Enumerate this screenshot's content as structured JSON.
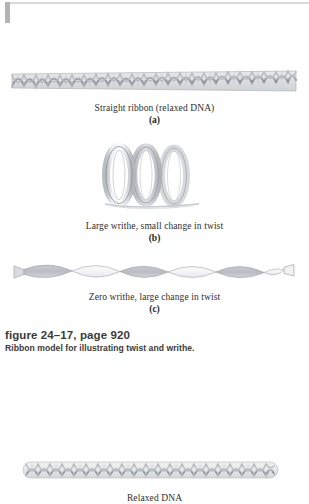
{
  "document": {
    "type": "textbook-figure-scan",
    "page_background": "#ffffff"
  },
  "figures": [
    {
      "id": "panel-a",
      "graphic": "straight-dna-ribbon",
      "caption": "Straight ribbon (relaxed DNA)",
      "letter": "(a)"
    },
    {
      "id": "panel-b",
      "graphic": "coiled-solenoid-loops",
      "caption": "Large writhe, small change in twist",
      "letter": "(b)"
    },
    {
      "id": "panel-c",
      "graphic": "flat-twisted-ribbon",
      "caption": "Zero writhe, large change in twist",
      "letter": "(c)"
    }
  ],
  "figure_label": {
    "title": "figure 24–17, page 920",
    "description": "Ribbon model for illustrating twist and writhe."
  },
  "bottom_figure": {
    "id": "panel-relaxed-dna",
    "graphic": "straight-dna-ribbon",
    "caption": "Relaxed DNA"
  },
  "colors": {
    "ribbon_fill": "#d8dadd",
    "ribbon_stroke": "#9a9da3",
    "helix_strand": "#8d9097",
    "coil_light": "#fbfbfc",
    "coil_shade": "#c6c9ce",
    "text_serif": "#2e2e2e",
    "text_label": "#3a3a3a",
    "scan_edge": "#b4b4b4",
    "scan_rule": "#d9d9d9"
  }
}
